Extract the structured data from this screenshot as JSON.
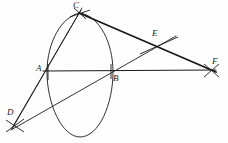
{
  "figure": {
    "kind": "geometric-construction-diagram",
    "canvas": {
      "width": 228,
      "height": 143
    },
    "background_color": "#fefefe",
    "ink_color": "#1a1a1a",
    "points": [
      {
        "id": "C",
        "label": "C",
        "x": 79,
        "y": 13,
        "label_x": 73,
        "label_y": 1,
        "marker": "x-cross"
      },
      {
        "id": "A",
        "label": "A",
        "x": 48,
        "y": 71,
        "label_x": 36,
        "label_y": 64,
        "marker": "tick"
      },
      {
        "id": "B",
        "label": "B",
        "x": 111,
        "y": 71,
        "label_x": 113,
        "label_y": 74,
        "marker": "tick"
      },
      {
        "id": "E",
        "label": "E",
        "x": 157,
        "y": 45,
        "label_x": 152,
        "label_y": 29,
        "marker": "x-cross"
      },
      {
        "id": "F",
        "label": "F",
        "x": 211,
        "y": 70,
        "label_x": 212,
        "label_y": 57,
        "marker": "x-cross"
      },
      {
        "id": "D",
        "label": "D",
        "x": 15,
        "y": 125,
        "label_x": 7,
        "label_y": 108,
        "marker": "x-cross"
      }
    ],
    "segments": [
      {
        "name": "line-D-A-C",
        "from": "D",
        "to": "C",
        "weight": "thin",
        "overshoot": 4
      },
      {
        "name": "line-A-B-F",
        "from": "A",
        "to": "F",
        "weight": "thin",
        "overshoot": 5
      },
      {
        "name": "line-C-E-F",
        "from": "C",
        "to": "F",
        "weight": "thick",
        "overshoot": 5
      },
      {
        "name": "line-D-B-E",
        "from": "D",
        "to": "E",
        "weight": "thin",
        "overshoot": 18
      },
      {
        "name": "line-C-B-D",
        "from": "C",
        "to": "D",
        "weight": "thin",
        "overshoot": 3
      }
    ],
    "curve": {
      "name": "oval-arc-through-C-and-B",
      "type": "closed-oval",
      "left_x": 47,
      "right_x": 113,
      "top_x": 80,
      "top_y": 13,
      "bottom_x": 80,
      "bottom_y": 137,
      "mid_y": 72
    }
  }
}
